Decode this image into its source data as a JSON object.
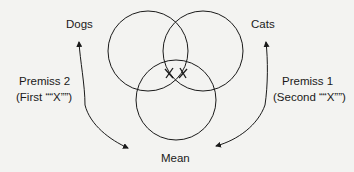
{
  "diagram": {
    "circles": [
      {
        "label": "Dogs",
        "cx": 148,
        "cy": 51,
        "r": 40
      },
      {
        "label": "Cats",
        "cx": 203,
        "cy": 51,
        "r": 40
      },
      {
        "label": "Mean",
        "cx": 176,
        "cy": 100,
        "r": 40
      }
    ],
    "labels": {
      "dogs": "Dogs",
      "cats": "Cats",
      "mean": "Mean",
      "premiss2_line1": "Premiss 2",
      "premiss2_line2": "(First ““X””)",
      "premiss1_line1": "Premiss 1",
      "premiss1_line2": "(Second ““X””)"
    },
    "marks": [
      {
        "symbol": "X",
        "x": 169,
        "y": 73
      },
      {
        "symbol": "X",
        "x": 183,
        "y": 73
      }
    ],
    "colors": {
      "line": "#1a1a1a",
      "background": "#f3f3f1"
    }
  }
}
